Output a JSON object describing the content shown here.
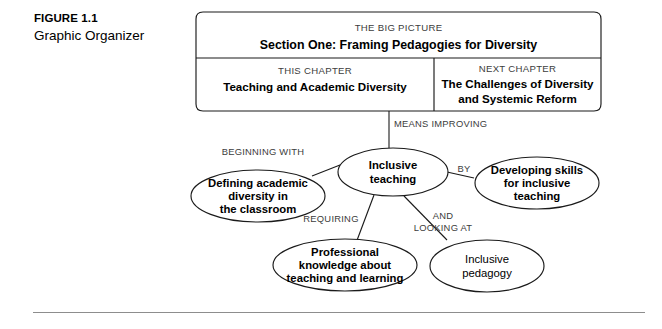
{
  "figure": {
    "label": "FIGURE 1.1",
    "title": "Graphic Organizer"
  },
  "organizer": {
    "big_picture": {
      "eyebrow": "THE BIG PICTURE",
      "title": "Section One: Framing Pedagogies for Diversity"
    },
    "this_chapter": {
      "eyebrow": "THIS CHAPTER",
      "title": "Teaching and Academic Diversity"
    },
    "next_chapter": {
      "eyebrow": "NEXT CHAPTER",
      "title_line1": "The Challenges of Diversity",
      "title_line2": "and Systemic Reform"
    },
    "connectors": {
      "means_improving": "MEANS IMPROVING",
      "beginning_with": "BEGINNING WITH",
      "by": "BY",
      "requiring": "REQUIRING",
      "and_looking_at_line1": "AND",
      "and_looking_at_line2": "LOOKING AT"
    },
    "nodes": {
      "center": {
        "line1": "Inclusive",
        "line2": "teaching"
      },
      "left": {
        "line1": "Defining academic",
        "line2": "diversity in",
        "line3": "the classroom"
      },
      "right": {
        "line1": "Developing skills",
        "line2": "for inclusive",
        "line3": "teaching"
      },
      "bottom_left": {
        "line1": "Professional",
        "line2": "knowledge about",
        "line3": "teaching and learning"
      },
      "bottom_right": {
        "line1": "Inclusive",
        "line2": "pedagogy"
      }
    }
  }
}
